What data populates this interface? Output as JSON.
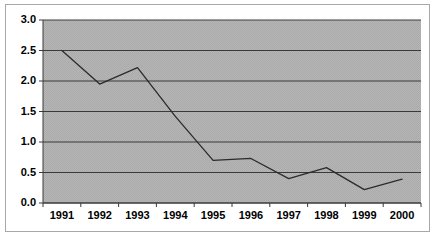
{
  "chart_data": {
    "type": "line",
    "title": "",
    "subtitle": "",
    "xlabel": "",
    "ylabel": "",
    "categories": [
      "1991",
      "1992",
      "1993",
      "1994",
      "1995",
      "1996",
      "1997",
      "1998",
      "1999",
      "2000"
    ],
    "series": [
      {
        "name": "series-1",
        "values": [
          2.5,
          1.95,
          2.22,
          1.42,
          0.7,
          0.73,
          0.4,
          0.58,
          0.22,
          0.39
        ]
      }
    ],
    "ylim": [
      0.0,
      3.0
    ],
    "y_ticks": [
      "0.0",
      "0.5",
      "1.0",
      "1.5",
      "2.0",
      "2.5",
      "3.0"
    ],
    "y_tick_values": [
      0.0,
      0.5,
      1.0,
      1.5,
      2.0,
      2.5,
      3.0
    ],
    "grid": true,
    "grid_axis": "y",
    "legend": false,
    "legend_position": "none",
    "markers": false,
    "line_color": "#2b2b2b",
    "plot_background_color": "#b3b3b3",
    "grid_color": "#3a3a3a",
    "axis_color": "#3a3a3a",
    "figure_background_color": "#ffffff",
    "frame_border_color": "#a8a8a8",
    "annotations": []
  }
}
